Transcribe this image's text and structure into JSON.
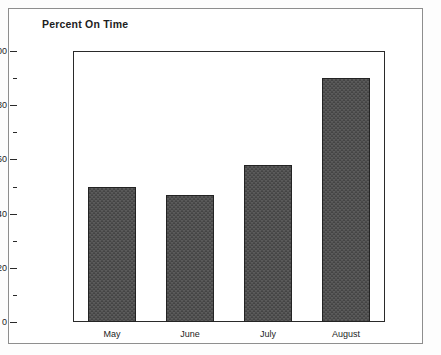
{
  "chart_data": {
    "type": "bar",
    "title": "Percent On Time",
    "xlabel": "",
    "ylabel": "",
    "categories": [
      "May",
      "June",
      "July",
      "August"
    ],
    "values": [
      50,
      47,
      58,
      90
    ],
    "series": [
      {
        "name": "Percent On Time",
        "values": [
          50,
          47,
          58,
          90
        ]
      }
    ],
    "ylim": [
      0,
      100
    ],
    "y_ticks": [
      0,
      20,
      40,
      60,
      80,
      100
    ],
    "y_tick_labels": [
      "0",
      "20",
      "40",
      "60",
      "80",
      "100"
    ],
    "y_minor_ticks": [
      10,
      30,
      50,
      70,
      90
    ],
    "grid": false,
    "legend": "none",
    "bar_color": "#4c4c4c",
    "bar_edge_color": "#232323",
    "plot_background": "#ffffff",
    "frame_color": "#2a2a2a",
    "outer_border_color": "#8e8e8e"
  }
}
